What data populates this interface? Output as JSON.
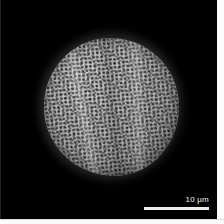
{
  "image": {
    "kind": "sem-micrograph",
    "subject": "pollen-grain",
    "background_color": "#000000",
    "alt_description": "Scanning electron micrograph of a single spheroidal pollen grain with a reticulate, finely pitted exine surface, centered on a black field."
  },
  "specimen": {
    "name": "pollen-grain",
    "shape": "spheroidal",
    "surface_texture": "reticulate-pitted exine",
    "features": [
      "longitudinal colpus ridge (left)",
      "longitudinal colpus ridge (right)",
      "median furrow shading"
    ],
    "highlight_color": "#c9c9c9",
    "midtone_color": "#9c9c9c",
    "shadow_color": "#3c3c3c"
  },
  "scalebar": {
    "value": "10",
    "unit": "µm",
    "label": "10 µm",
    "bar_color": "#ededed",
    "text_color": "#f2f2f2",
    "length_px": "65",
    "position": "bottom-right"
  },
  "frame": {
    "margin_color": "#fdfdfd",
    "edge_line_color": "#3a3a3a"
  }
}
